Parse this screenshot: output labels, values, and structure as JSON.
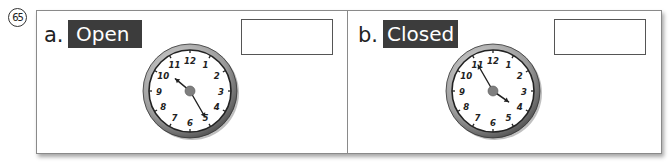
{
  "question": {
    "number": "65",
    "number_display": "65"
  },
  "panels": [
    {
      "letter": "a.",
      "label": "Open",
      "answer": "",
      "clock": {
        "hour_hand_deg": 310,
        "minute_hand_deg": 150,
        "numerals": [
          "12",
          "1",
          "2",
          "3",
          "4",
          "5",
          "6",
          "7",
          "8",
          "9",
          "10",
          "11"
        ]
      }
    },
    {
      "letter": "b.",
      "label": "Closed",
      "answer": "",
      "clock": {
        "hour_hand_deg": 125,
        "minute_hand_deg": 330,
        "numerals": [
          "12",
          "1",
          "2",
          "3",
          "4",
          "5",
          "6",
          "7",
          "8",
          "9",
          "10",
          "11"
        ]
      }
    }
  ],
  "colors": {
    "tag_bg": "#3c3c3c",
    "tag_text": "#ffffff",
    "border": "#8a8a8a",
    "clock_rim": "#6f6f6f",
    "clock_center": "#808080"
  }
}
